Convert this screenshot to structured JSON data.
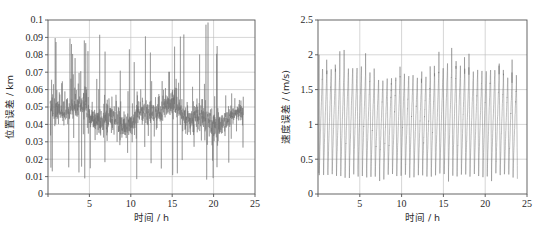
{
  "page": {
    "background": "#ffffff",
    "ghost_text_top": "",
    "ghost_text_bottom": ""
  },
  "colors": {
    "axis": "#555555",
    "grid": "#b9b9b9",
    "data": "#6f6f6f",
    "text": "#2a2a2a"
  },
  "chart_data": [
    {
      "type": "line",
      "id": "position-error",
      "title": "",
      "xlabel": "时间 / h",
      "ylabel": "位置误差 / km",
      "xlim": [
        0,
        25
      ],
      "ylim": [
        0,
        0.1
      ],
      "xticks": [
        0,
        5,
        10,
        15,
        20,
        25
      ],
      "xticklabels": [
        "0",
        "5",
        "10",
        "15",
        "20",
        "25"
      ],
      "yticks": [
        0,
        0.01,
        0.02,
        0.03,
        0.04,
        0.05,
        0.06,
        0.07,
        0.08,
        0.09,
        0.1
      ],
      "yticklabels": [
        "0",
        "0.01",
        "0.02",
        "0.03",
        "0.04",
        "0.05",
        "0.06",
        "0.07",
        "0.08",
        "0.09",
        "0.1"
      ],
      "grid": true,
      "legend": null,
      "series": [
        {
          "name": "position error",
          "color": "#6f6f6f",
          "description": "dense high-frequency noise band centred near 0.045 km, envelope roughly 0.010 to 0.075 km with sparse spikes reaching 0.099 km",
          "mean": 0.045,
          "band_low": 0.012,
          "band_high": 0.072,
          "spike_max": 0.099,
          "spike_min": 0.008,
          "n_points": 1400,
          "x": [
            0,
            25
          ]
        }
      ]
    },
    {
      "type": "line",
      "id": "velocity-error",
      "title": "",
      "xlabel": "时间 / h",
      "ylabel": "速度误差 / (m/s)",
      "xlim": [
        0,
        25
      ],
      "ylim": [
        0,
        2.5
      ],
      "xticks": [
        0,
        5,
        10,
        15,
        20,
        25
      ],
      "xticklabels": [
        "0",
        "5",
        "10",
        "15",
        "20",
        "25"
      ],
      "yticks": [
        0,
        0.5,
        1,
        1.5,
        2,
        2.5
      ],
      "yticklabels": [
        "0",
        "0.5",
        "1",
        "1.5",
        "2",
        "2.5"
      ],
      "grid": true,
      "legend": null,
      "series": [
        {
          "name": "velocity error",
          "color": "#6f6f6f",
          "description": "regular sawtooth oscillation, about 46 cycles across 24 h, troughs near 0.25 m/s and peaks near 1.75 m/s with occasional peaks to 2.1 m/s",
          "cycles": 46,
          "trough": 0.25,
          "peak": 1.75,
          "peak_max": 2.1,
          "n_points": 2400,
          "x": [
            0,
            24
          ]
        }
      ]
    }
  ]
}
